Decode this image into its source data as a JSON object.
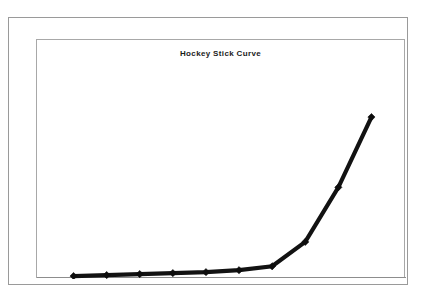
{
  "page": {
    "background_color": "#ffffff",
    "frame_border_color": "#9a9a9a",
    "plot_border_color": "#a8a8a8"
  },
  "chart_data": {
    "type": "line",
    "title": "Hockey Stick Curve",
    "xlabel": "",
    "ylabel": "",
    "grid": false,
    "legend": "none",
    "series_color": "#121212",
    "marker": "diamond",
    "x": [
      1,
      2,
      3,
      4,
      5,
      6,
      7,
      8,
      9,
      10
    ],
    "xlim": [
      0.5,
      10.5
    ],
    "ylim": [
      0,
      100
    ],
    "xticklabels": [],
    "yticklabels": [],
    "series": [
      {
        "name": "Hockey Stick Curve",
        "values": [
          0.5,
          1,
          1.5,
          2,
          2.5,
          3.5,
          5.5,
          18,
          46,
          82
        ]
      }
    ],
    "annotations": []
  }
}
